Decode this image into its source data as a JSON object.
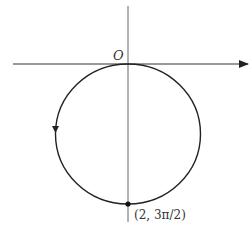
{
  "figure": {
    "type": "polar-curve-plot",
    "origin_label": "O",
    "point_label": "(2, 3π/2)",
    "curve": "circle tangent to polar axis at origin, lying below; traversed counterclockwise as drawn (arrow pointing down on left side)",
    "colors": {
      "stroke": "#222222",
      "background": "#ffffff"
    }
  }
}
